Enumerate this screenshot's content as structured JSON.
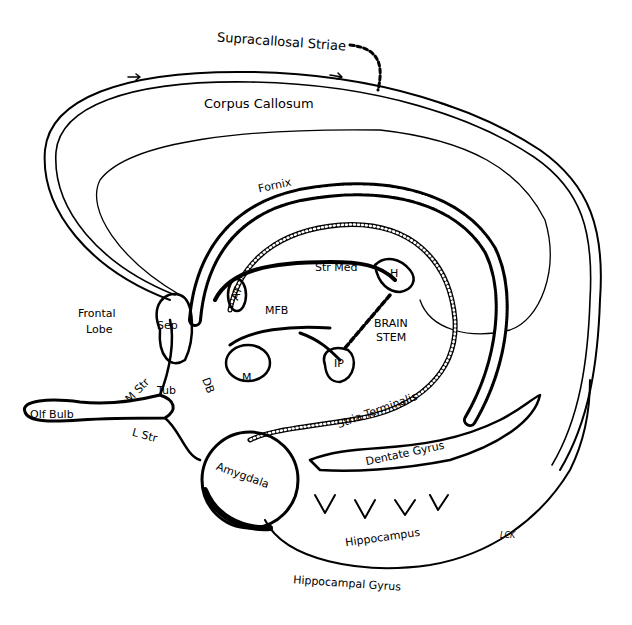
{
  "figure": {
    "background": "#ffffff",
    "ink": "#000000"
  },
  "labels": {
    "supracallosal_striae": "Supracallosal Striae",
    "corpus_callosum": "Corpus Callosum",
    "fornix": "Fornix",
    "str_med": "Str Med",
    "h": "H",
    "mfb": "MFB",
    "brain": "BRAIN",
    "stem": "STEM",
    "ip": "IP",
    "frontal": "Frontal",
    "lobe": "Lobe",
    "sep": "Sep",
    "at": "AT",
    "m": "M",
    "m_str": "M Str",
    "tub": "Tub",
    "db": "DB",
    "olf_bulb": "Olf Bulb",
    "l_str": "L Str",
    "stria_terminalis": "Stria Terminalis",
    "amygdala": "Amygdala",
    "dentate_gyrus": "Dentate Gyrus",
    "hippocampus": "Hippocampus",
    "hippocampal_gyrus": "Hippocampal Gyrus",
    "signature": "LCK"
  }
}
